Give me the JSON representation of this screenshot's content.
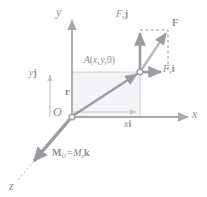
{
  "figure": {
    "colors": {
      "axis_gray": "#a8a8ad",
      "vector_gray": "#9a9aa0",
      "label_gray": "#8d8d92",
      "guide_light": "#c9c9ce",
      "fill_light": "#f2f2f4",
      "background": "#ffffff"
    },
    "axes": {
      "y_label": "y",
      "x_label": "x",
      "z_label": "z",
      "origin_label": "O"
    },
    "points": {
      "a_label_full": "A(x, y,0)",
      "a_label_name": "A",
      "a_label_paren_open": "(",
      "a_label_x": "x",
      "a_label_comma1": ",",
      "a_label_y": "y",
      "a_label_comma2": ",",
      "a_label_zero": "0",
      "a_label_paren_close": ")"
    },
    "vectors": {
      "force_label": "F",
      "force_y_component": "F",
      "force_y_sub": "y",
      "force_y_unit": "j",
      "force_x_component": "F",
      "force_x_sub": "x",
      "force_x_unit": "i",
      "position_label": "r",
      "y_projection_value": "y",
      "y_projection_unit": "j",
      "x_projection_value": "x",
      "x_projection_unit": "i"
    },
    "moment": {
      "symbol": "M",
      "symbol_sub": "O",
      "equals": "=",
      "magnitude": "M",
      "magnitude_sub": "z",
      "unit_vector": "k",
      "full": "M_O = M_z k"
    }
  }
}
